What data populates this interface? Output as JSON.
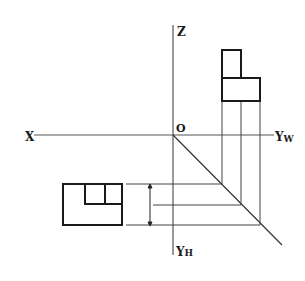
{
  "diagram": {
    "type": "orthographic-projection",
    "axes": {
      "x_label": "X",
      "z_label": "Z",
      "origin_label": "O",
      "yw_label": "Y",
      "yw_sub": "W",
      "yh_label": "Y",
      "yh_sub": "H"
    },
    "side_view": {
      "upper_rect": {
        "x": 222,
        "y": 50,
        "w": 19,
        "h": 28
      },
      "lower_rect": {
        "x": 222,
        "y": 78,
        "w": 38,
        "h": 23
      }
    },
    "top_view": {
      "outer_rect": {
        "x": 63,
        "y": 184,
        "w": 59,
        "h": 41
      },
      "inner_step_y": 204,
      "inner_left_x": 85,
      "inner_divider_x": 105
    },
    "colors": {
      "line": "#1a1a1a",
      "axis": "#555555",
      "background": "#ffffff"
    }
  }
}
